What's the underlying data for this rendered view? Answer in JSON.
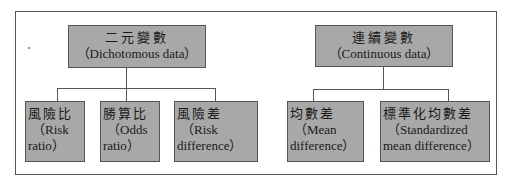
{
  "groups": [
    {
      "title_zh": "二元變數",
      "title_en": "（Dichotomous data）",
      "children": [
        {
          "zh": "風險比",
          "en1": "（Risk",
          "en2": "ratio）"
        },
        {
          "zh": "勝算比",
          "en1": "（Odds",
          "en2": "ratio）"
        },
        {
          "zh": "風險差",
          "en1": "（Risk",
          "en2": "difference）"
        }
      ]
    },
    {
      "title_zh": "連續變數",
      "title_en": "（Continuous data）",
      "children": [
        {
          "zh": "均數差",
          "en1": "（Mean",
          "en2": "difference）"
        },
        {
          "zh": "標準化均數差",
          "en1": "（Standardized",
          "en2": "mean difference）"
        }
      ]
    }
  ],
  "colors": {
    "box_fill": "#a8a8a8",
    "border": "#555555"
  }
}
